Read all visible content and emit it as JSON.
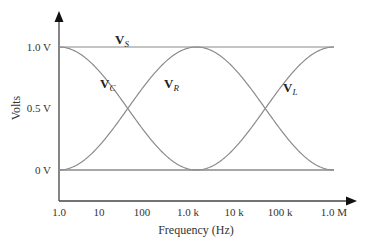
{
  "chart_data": {
    "type": "line",
    "title": "",
    "xlabel": "Frequency (Hz)",
    "ylabel": "Volts",
    "x_scale": "log",
    "x_ticks": [
      1,
      10,
      100,
      1000,
      10000,
      100000,
      1000000
    ],
    "x_tick_labels": [
      "1.0",
      "10",
      "100",
      "1.0 k",
      "10 k",
      "100 k",
      "1.0 M"
    ],
    "y_ticks": [
      0,
      0.5,
      1.0
    ],
    "y_tick_labels": [
      "0 V",
      "0.5 V",
      "1.0 V"
    ],
    "xlim": [
      1,
      1000000
    ],
    "ylim": [
      0,
      1.0
    ],
    "grid": false,
    "legend": "inline labels on curves",
    "resonance_frequency_hz": 1000,
    "series": [
      {
        "name": "VS",
        "label_main": "V",
        "label_sub": "S",
        "description": "Source voltage, constant",
        "x": [
          1,
          1000000
        ],
        "values": [
          1.0,
          1.0
        ]
      },
      {
        "name": "VC",
        "label_main": "V",
        "label_sub": "C",
        "description": "Capacitor voltage, falls from 1 V at low frequency to 0 V near 1 kHz",
        "x": [
          1,
          10,
          63,
          300,
          1000,
          1000000
        ],
        "values": [
          1.0,
          0.85,
          0.5,
          0.1,
          0.0,
          0.0
        ]
      },
      {
        "name": "VR",
        "label_main": "V",
        "label_sub": "R",
        "description": "Resistor voltage, peaks at 1 V at resonance (~1 kHz)",
        "x": [
          1,
          10,
          63,
          1000,
          18000,
          100000,
          1000000
        ],
        "values": [
          0.0,
          0.15,
          0.5,
          1.0,
          0.5,
          0.15,
          0.0
        ]
      },
      {
        "name": "VL",
        "label_main": "V",
        "label_sub": "L",
        "description": "Inductor voltage, rises from 0 V near 1 kHz to 1 V at high frequency",
        "x": [
          1,
          1000,
          3000,
          18000,
          100000,
          1000000
        ],
        "values": [
          0.0,
          0.0,
          0.1,
          0.5,
          0.85,
          1.0
        ]
      }
    ],
    "labels": {
      "y_axis_title": "Volts",
      "x_axis_title": "Frequency (Hz)"
    }
  }
}
